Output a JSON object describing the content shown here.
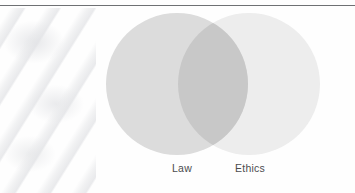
{
  "figure": {
    "type": "venn-diagram",
    "background_color": "#fefefe",
    "rule_color": "#6e7073",
    "label_color": "#4b4c4e",
    "watermark_alt": ""
  },
  "chart_data": {
    "type": "venn",
    "title": "",
    "subtitle": "",
    "xlabel": "",
    "ylabel": "",
    "legend_position": "below-circles",
    "grid": false,
    "sets": [
      {
        "name": "Law",
        "label": "Law",
        "fill": "#dcdcdc",
        "cx": 177,
        "cy": 84,
        "r": 71,
        "label_x": 182,
        "label_y": 170
      },
      {
        "name": "Ethics",
        "label": "Ethics",
        "fill": "#ededed",
        "cx": 249,
        "cy": 84,
        "r": 71,
        "label_x": 250,
        "label_y": 170
      }
    ],
    "intersection": {
      "label": "",
      "fill": "#c8c8c8",
      "left_bound_x": 186,
      "right_bound_x": 240
    },
    "annotations": []
  }
}
